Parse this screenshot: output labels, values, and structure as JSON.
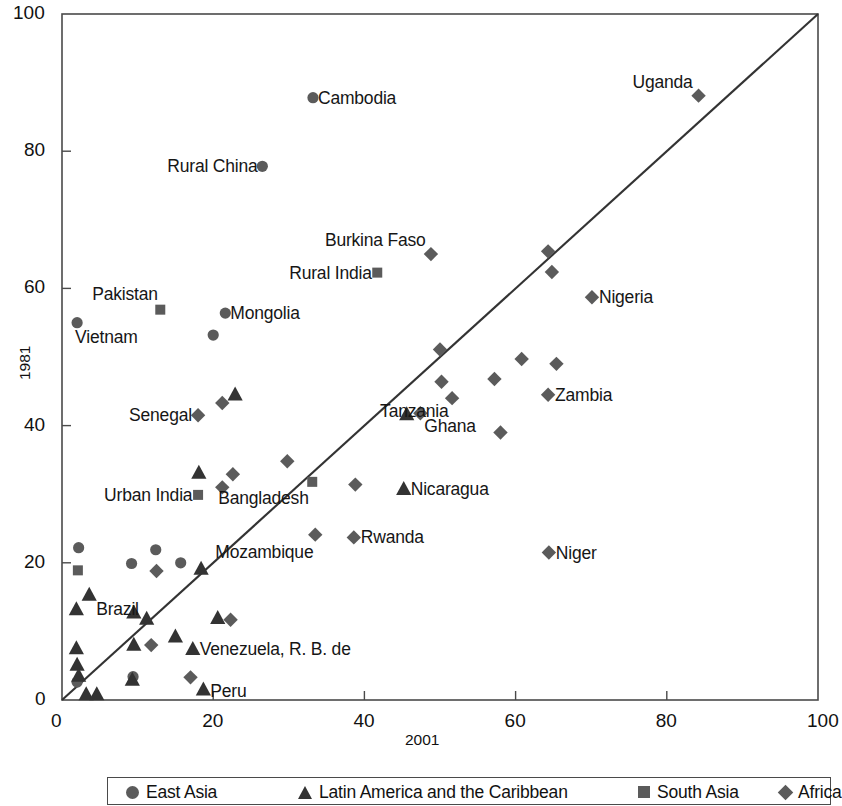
{
  "chart_data": {
    "type": "scatter",
    "title": "",
    "xlabel": "2001",
    "ylabel": "1981",
    "xlim": [
      0,
      100
    ],
    "ylim": [
      0,
      100
    ],
    "xticks": [
      0,
      20,
      40,
      60,
      80,
      100
    ],
    "yticks": [
      0,
      20,
      40,
      60,
      80,
      100
    ],
    "grid": false,
    "reference_line": {
      "from": [
        0,
        0
      ],
      "to": [
        100,
        100
      ],
      "label": "45-degree line"
    },
    "legend_position": "bottom",
    "legend": [
      {
        "label": "East Asia",
        "marker": "circle"
      },
      {
        "label": "Latin America and the Caribbean",
        "marker": "triangle"
      },
      {
        "label": "South Asia",
        "marker": "square"
      },
      {
        "label": "Africa",
        "marker": "diamond"
      }
    ],
    "series": [
      {
        "name": "East Asia",
        "marker": "circle",
        "points": [
          {
            "label": "Cambodia",
            "x": 33.2,
            "y": 87.8,
            "lx": 5,
            "ly": 0,
            "anchor": "left"
          },
          {
            "label": "Rural China",
            "x": 26.5,
            "y": 77.8,
            "lx": -5,
            "ly": 0,
            "anchor": "right"
          },
          {
            "label": "Mongolia",
            "x": 21.6,
            "y": 56.4,
            "lx": 5,
            "ly": 0,
            "anchor": "left"
          },
          {
            "label": "Vietnam",
            "x": 2.0,
            "y": 55.0,
            "lx": -2,
            "ly": 14,
            "anchor": "left"
          },
          {
            "label": "",
            "x": 20.0,
            "y": 53.2
          },
          {
            "label": "",
            "x": 2.2,
            "y": 22.2
          },
          {
            "label": "",
            "x": 9.2,
            "y": 19.9
          },
          {
            "label": "",
            "x": 15.7,
            "y": 20.0
          },
          {
            "label": "",
            "x": 12.4,
            "y": 21.9
          },
          {
            "label": "",
            "x": 9.4,
            "y": 3.4
          },
          {
            "label": "",
            "x": 2.0,
            "y": 2.6
          }
        ]
      },
      {
        "name": "Latin America and the Caribbean",
        "marker": "triangle",
        "points": [
          {
            "label": "Nicaragua",
            "x": 45.2,
            "y": 30.8,
            "lx": 7,
            "ly": 0,
            "anchor": "left"
          },
          {
            "label": "",
            "x": 45.6,
            "y": 41.7
          },
          {
            "label": "",
            "x": 22.9,
            "y": 44.6
          },
          {
            "label": "",
            "x": 18.1,
            "y": 33.2
          },
          {
            "label": "Brazil",
            "x": 3.6,
            "y": 15.4,
            "lx": 7,
            "ly": 15,
            "anchor": "left"
          },
          {
            "label": "",
            "x": 1.9,
            "y": 13.3
          },
          {
            "label": "",
            "x": 18.4,
            "y": 19.2
          },
          {
            "label": "",
            "x": 9.5,
            "y": 12.8
          },
          {
            "label": "",
            "x": 11.2,
            "y": 11.9
          },
          {
            "label": "",
            "x": 20.6,
            "y": 12.0
          },
          {
            "label": "",
            "x": 15.0,
            "y": 9.3
          },
          {
            "label": "",
            "x": 9.5,
            "y": 8.1
          },
          {
            "label": "Venezuela, R. B. de",
            "x": 17.3,
            "y": 7.5,
            "lx": 7,
            "ly": 0,
            "anchor": "left"
          },
          {
            "label": "",
            "x": 1.9,
            "y": 7.6
          },
          {
            "label": "",
            "x": 2.0,
            "y": 5.2
          },
          {
            "label": "",
            "x": 2.2,
            "y": 3.6
          },
          {
            "label": "",
            "x": 9.3,
            "y": 3.0
          },
          {
            "label": "Peru",
            "x": 18.7,
            "y": 1.6,
            "lx": 7,
            "ly": 2,
            "anchor": "left"
          },
          {
            "label": "",
            "x": 3.2,
            "y": 0.9
          },
          {
            "label": "",
            "x": 4.6,
            "y": 0.9
          }
        ]
      },
      {
        "name": "South Asia",
        "marker": "square",
        "points": [
          {
            "label": "Rural India",
            "x": 41.7,
            "y": 62.3,
            "lx": -6,
            "ly": 0,
            "anchor": "right"
          },
          {
            "label": "Pakistan",
            "x": 13.0,
            "y": 56.9,
            "lx": -2,
            "ly": -16,
            "anchor": "right"
          },
          {
            "label": "Urban India",
            "x": 18.0,
            "y": 29.9,
            "lx": -6,
            "ly": 0,
            "anchor": "right"
          },
          {
            "label": "Bangladesh",
            "x": 33.1,
            "y": 31.8,
            "lx": -4,
            "ly": 16,
            "anchor": "right"
          },
          {
            "label": "",
            "x": 2.1,
            "y": 18.9
          }
        ]
      },
      {
        "name": "Africa",
        "marker": "diamond",
        "points": [
          {
            "label": "Uganda",
            "x": 84.2,
            "y": 88.1,
            "lx": -6,
            "ly": -14,
            "anchor": "right"
          },
          {
            "label": "Burkina Faso",
            "x": 48.8,
            "y": 65.0,
            "lx": -5,
            "ly": -14,
            "anchor": "right"
          },
          {
            "label": "",
            "x": 64.3,
            "y": 65.4
          },
          {
            "label": "",
            "x": 64.8,
            "y": 62.4
          },
          {
            "label": "Nigeria",
            "x": 70.1,
            "y": 58.7,
            "lx": 7,
            "ly": 0,
            "anchor": "left"
          },
          {
            "label": "",
            "x": 50.0,
            "y": 51.1
          },
          {
            "label": "",
            "x": 60.8,
            "y": 49.7
          },
          {
            "label": "",
            "x": 65.4,
            "y": 49.0
          },
          {
            "label": "",
            "x": 50.2,
            "y": 46.4
          },
          {
            "label": "",
            "x": 57.2,
            "y": 46.8
          },
          {
            "label": "Tanzania",
            "x": 51.6,
            "y": 44.0,
            "lx": -4,
            "ly": 13,
            "anchor": "right"
          },
          {
            "label": "Zambia",
            "x": 64.3,
            "y": 44.5,
            "lx": 7,
            "ly": 0,
            "anchor": "left"
          },
          {
            "label": "Ghana",
            "x": 47.4,
            "y": 41.8,
            "lx": 4,
            "ly": 13,
            "anchor": "left"
          },
          {
            "label": "",
            "x": 58.0,
            "y": 39.0
          },
          {
            "label": "Senegal",
            "x": 18.0,
            "y": 41.5,
            "lx": -6,
            "ly": 0,
            "anchor": "right"
          },
          {
            "label": "",
            "x": 21.2,
            "y": 43.3
          },
          {
            "label": "",
            "x": 29.8,
            "y": 34.8
          },
          {
            "label": "",
            "x": 22.6,
            "y": 32.9
          },
          {
            "label": "",
            "x": 21.2,
            "y": 31.0
          },
          {
            "label": "",
            "x": 38.8,
            "y": 31.4
          },
          {
            "label": "Mozambique",
            "x": 33.5,
            "y": 24.1,
            "lx": -2,
            "ly": 17,
            "anchor": "right"
          },
          {
            "label": "Rwanda",
            "x": 38.6,
            "y": 23.7,
            "lx": 7,
            "ly": 0,
            "anchor": "left"
          },
          {
            "label": "Niger",
            "x": 64.4,
            "y": 21.5,
            "lx": 7,
            "ly": 0,
            "anchor": "left"
          },
          {
            "label": "",
            "x": 12.5,
            "y": 18.8
          },
          {
            "label": "",
            "x": 22.3,
            "y": 11.7
          },
          {
            "label": "",
            "x": 11.8,
            "y": 8.0
          },
          {
            "label": "",
            "x": 17.0,
            "y": 3.3
          }
        ]
      }
    ]
  },
  "colors": {
    "marker": "#5b5b5b",
    "triangle": "#333333",
    "axis": "#4a4a4a",
    "text": "#161616",
    "line": "#333333"
  }
}
